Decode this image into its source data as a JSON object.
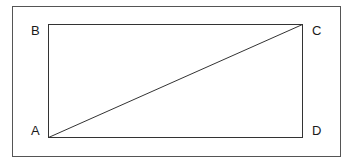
{
  "diagram": {
    "type": "rectangle-with-diagonal",
    "vertices": {
      "A": {
        "label": "A",
        "position": "bottom-left"
      },
      "B": {
        "label": "B",
        "position": "top-left"
      },
      "C": {
        "label": "C",
        "position": "top-right"
      },
      "D": {
        "label": "D",
        "position": "bottom-right"
      }
    },
    "edges": [
      "AB",
      "BC",
      "CD",
      "DA"
    ],
    "diagonal": "AC",
    "colors": {
      "line": "#333333",
      "frame": "#555555",
      "background": "#ffffff"
    }
  }
}
